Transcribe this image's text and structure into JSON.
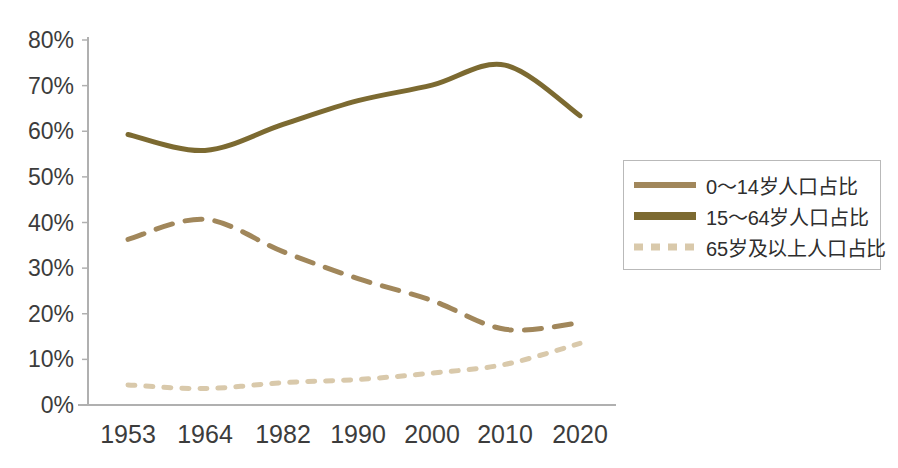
{
  "chart_data": {
    "type": "line",
    "title": "",
    "xlabel": "",
    "ylabel": "",
    "categories": [
      "1953",
      "1964",
      "1982",
      "1990",
      "2000",
      "2010",
      "2020"
    ],
    "ylim": [
      0,
      80
    ],
    "yticks": [
      "0%",
      "10%",
      "20%",
      "30%",
      "40%",
      "50%",
      "60%",
      "70%",
      "80%"
    ],
    "ytick_values": [
      0,
      10,
      20,
      30,
      40,
      50,
      60,
      70,
      80
    ],
    "grid": false,
    "legend_position": "right",
    "series": [
      {
        "name": "0～14岁人口占比",
        "values": [
          36.3,
          40.7,
          33.6,
          27.7,
          22.9,
          16.6,
          18.0
        ],
        "color": "#A1875B",
        "style": "dashed",
        "width": 5
      },
      {
        "name": "15～64岁人口占比",
        "values": [
          59.3,
          55.8,
          61.5,
          66.7,
          70.1,
          74.5,
          63.4
        ],
        "color": "#7C6A31",
        "style": "solid",
        "width": 5
      },
      {
        "name": "65岁及以上人口占比",
        "values": [
          4.4,
          3.6,
          4.9,
          5.6,
          7.0,
          8.9,
          13.5
        ],
        "color": "#D9C9AB",
        "style": "dotted",
        "width": 5
      }
    ]
  },
  "axis": {
    "axis_color": "#b0b0b0",
    "tick_text_color": "#3c3c3c"
  },
  "legend": {
    "border_color": "#b9b9b9",
    "entries": [
      {
        "label": "0～14岁人口占比",
        "color": "#A1875B",
        "style": "solid",
        "thickness": 6
      },
      {
        "label": "15～64岁人口占比",
        "color": "#7C6A31",
        "style": "solid",
        "thickness": 8
      },
      {
        "label": "65岁及以上人口占比",
        "color": "#D9C9AB",
        "style": "dashed",
        "thickness": 7
      }
    ]
  }
}
